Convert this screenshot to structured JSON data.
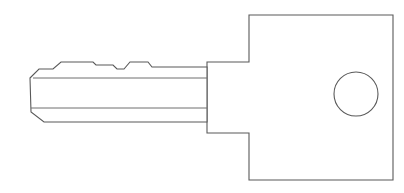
{
  "document": {
    "title": "Key Line Drawing",
    "type": "technical-line-drawing",
    "subject": "key",
    "orientation": "horizontal, blade pointing left, bow at right",
    "canvas": {
      "width": 404,
      "height": 193,
      "background_color": "#ffffff"
    }
  },
  "style": {
    "outline_color": "#595959",
    "groove_color": "#6e6e6e",
    "fill_color": "#ffffff",
    "outline_width": 1.1,
    "groove_width": 1.0
  },
  "geometry": {
    "blade": {
      "name": "key-blade",
      "description": "Left-pointing blade with chamfered tip and two cut notches along the top edge",
      "outline_points": "30,78 39,69 53,69 61,62 93,62 96,65 113,65 117,69 124,69 130,62 148,62 152,67 207,67 207,122 44,122 31,112",
      "tip_x": 30,
      "shoulder_x": 207,
      "top_y": 62,
      "bottom_y": 122
    },
    "grooves": [
      {
        "name": "blade-groove-upper",
        "points": "33,78 45,78 207,78",
        "y": 78
      },
      {
        "name": "blade-groove-lower",
        "points": "31,108 45,108 207,108",
        "y": 108
      }
    ],
    "shoulder": {
      "name": "key-shoulder-step",
      "left_x": 207,
      "right_x": 249,
      "top_y": 62,
      "bottom_y": 133
    },
    "bow": {
      "name": "key-bow",
      "description": "Large rectangular head of the key",
      "left_x": 249,
      "right_x": 393,
      "top_y": 15,
      "bottom_y": 180
    },
    "bow_outline_points": "249,15 393,15 393,180 249,180 249,133 207,133 207,62 249,62",
    "hole": {
      "name": "key-bow-hole",
      "center_x": 356,
      "center_y": 94,
      "radius": 22
    }
  },
  "parts": [
    {
      "id": "blade",
      "label": "Blade"
    },
    {
      "id": "tip",
      "label": "Tip"
    },
    {
      "id": "notches",
      "label": "Cuts / Notches"
    },
    {
      "id": "grooves",
      "label": "Grooves"
    },
    {
      "id": "shoulder",
      "label": "Shoulder"
    },
    {
      "id": "bow",
      "label": "Bow"
    },
    {
      "id": "hole",
      "label": "Key Ring Hole"
    }
  ]
}
